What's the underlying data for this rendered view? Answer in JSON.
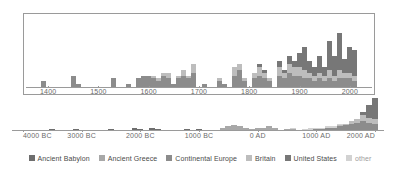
{
  "chart_data": {
    "type": "bar",
    "title": "",
    "subtitle": "",
    "xlabel": "",
    "ylabel": "",
    "grid": false,
    "legend_position": "bottom",
    "stacked": true,
    "series_names": [
      "Ancient Babylon",
      "Ancient Greece",
      "Continental Europe",
      "Britain",
      "United States",
      "other"
    ],
    "series_colors": [
      "#6e6e6e",
      "#a8a8a8",
      "#8c8c8c",
      "#bdbdbd",
      "#777777",
      "#d2d2d2"
    ],
    "panels": [
      {
        "name": "inset-recent",
        "xlim": [
          1350,
          2050
        ],
        "ylim": [
          0,
          26
        ],
        "xticks": [
          1400,
          1500,
          1600,
          1700,
          1800,
          1900,
          2000
        ],
        "xticklabels": [
          "1400",
          "1500",
          "1600",
          "1700",
          "1800",
          "1900",
          "2000"
        ],
        "bin_width": 10,
        "bins": [
          {
            "x": 1390,
            "values": [
              0,
              0,
              2,
              0,
              0,
              0
            ]
          },
          {
            "x": 1450,
            "values": [
              0,
              0,
              4,
              0,
              0,
              0
            ]
          },
          {
            "x": 1460,
            "values": [
              0,
              0,
              1,
              0,
              0,
              0
            ]
          },
          {
            "x": 1530,
            "values": [
              0,
              0,
              3,
              0,
              0,
              0
            ]
          },
          {
            "x": 1560,
            "values": [
              0,
              0,
              1,
              0,
              0,
              0
            ]
          },
          {
            "x": 1580,
            "values": [
              0,
              0,
              3,
              0,
              0,
              0
            ]
          },
          {
            "x": 1590,
            "values": [
              0,
              0,
              4,
              0,
              0,
              0
            ]
          },
          {
            "x": 1600,
            "values": [
              0,
              0,
              4,
              0,
              0,
              0
            ]
          },
          {
            "x": 1610,
            "values": [
              0,
              0,
              3,
              1,
              0,
              0
            ]
          },
          {
            "x": 1620,
            "values": [
              0,
              0,
              2,
              1,
              0,
              0
            ]
          },
          {
            "x": 1630,
            "values": [
              0,
              0,
              4,
              1,
              0,
              0
            ]
          },
          {
            "x": 1640,
            "values": [
              0,
              0,
              3,
              2,
              0,
              0
            ]
          },
          {
            "x": 1650,
            "values": [
              0,
              0,
              1,
              0,
              0,
              0
            ]
          },
          {
            "x": 1660,
            "values": [
              0,
              0,
              3,
              1,
              0,
              0
            ]
          },
          {
            "x": 1670,
            "values": [
              0,
              0,
              4,
              2,
              0,
              0
            ]
          },
          {
            "x": 1680,
            "values": [
              0,
              0,
              3,
              1,
              0,
              0
            ]
          },
          {
            "x": 1690,
            "values": [
              0,
              0,
              5,
              3,
              0,
              0
            ]
          },
          {
            "x": 1710,
            "values": [
              0,
              0,
              1,
              0,
              0,
              0
            ]
          },
          {
            "x": 1740,
            "values": [
              0,
              0,
              2,
              1,
              0,
              0
            ]
          },
          {
            "x": 1750,
            "values": [
              0,
              0,
              1,
              0,
              0,
              0
            ]
          },
          {
            "x": 1770,
            "values": [
              0,
              0,
              4,
              3,
              0,
              0
            ]
          },
          {
            "x": 1780,
            "values": [
              0,
              0,
              6,
              2,
              0,
              0
            ]
          },
          {
            "x": 1790,
            "values": [
              0,
              0,
              2,
              1,
              0,
              0
            ]
          },
          {
            "x": 1810,
            "values": [
              0,
              0,
              3,
              2,
              0,
              0
            ]
          },
          {
            "x": 1820,
            "values": [
              0,
              0,
              4,
              3,
              1,
              0
            ]
          },
          {
            "x": 1830,
            "values": [
              0,
              0,
              3,
              2,
              1,
              0
            ]
          },
          {
            "x": 1840,
            "values": [
              0,
              0,
              2,
              1,
              0,
              0
            ]
          },
          {
            "x": 1860,
            "values": [
              0,
              0,
              4,
              3,
              2,
              0
            ]
          },
          {
            "x": 1870,
            "values": [
              0,
              0,
              3,
              2,
              1,
              0
            ]
          },
          {
            "x": 1880,
            "values": [
              0,
              0,
              5,
              3,
              3,
              0
            ]
          },
          {
            "x": 1890,
            "values": [
              0,
              0,
              4,
              3,
              2,
              0
            ]
          },
          {
            "x": 1900,
            "values": [
              0,
              0,
              4,
              3,
              5,
              0
            ]
          },
          {
            "x": 1910,
            "values": [
              0,
              0,
              3,
              3,
              8,
              0
            ]
          },
          {
            "x": 1920,
            "values": [
              0,
              0,
              3,
              2,
              4,
              0
            ]
          },
          {
            "x": 1930,
            "values": [
              0,
              0,
              2,
              2,
              3,
              0
            ]
          },
          {
            "x": 1940,
            "values": [
              0,
              0,
              3,
              2,
              6,
              0
            ]
          },
          {
            "x": 1950,
            "values": [
              0,
              0,
              2,
              2,
              3,
              0
            ]
          },
          {
            "x": 1960,
            "values": [
              0,
              0,
              3,
              3,
              10,
              0
            ]
          },
          {
            "x": 1970,
            "values": [
              0,
              0,
              2,
              2,
              7,
              0
            ]
          },
          {
            "x": 1980,
            "values": [
              0,
              0,
              3,
              3,
              13,
              0
            ]
          },
          {
            "x": 1990,
            "values": [
              0,
              0,
              3,
              2,
              5,
              0
            ]
          },
          {
            "x": 2000,
            "values": [
              0,
              0,
              3,
              2,
              9,
              0
            ]
          },
          {
            "x": 2010,
            "values": [
              0,
              0,
              2,
              2,
              9,
              0
            ]
          }
        ]
      },
      {
        "name": "full-range",
        "xlim": [
          -4000,
          2000
        ],
        "ylim": [
          0,
          26
        ],
        "xticks": [
          -4000,
          -3000,
          -2000,
          -1000,
          0,
          1000,
          2000
        ],
        "xticklabels": [
          "4000 BC",
          "3000 BC",
          "2000 BC",
          "1000 BC",
          "0 AD",
          "1000 AD",
          "2000 AD"
        ],
        "bin_width": 100,
        "bins": [
          {
            "x": -3500,
            "values": [
              1,
              0,
              0,
              0,
              0,
              0
            ]
          },
          {
            "x": -3100,
            "values": [
              1,
              0,
              0,
              0,
              0,
              0
            ]
          },
          {
            "x": -2500,
            "values": [
              1,
              0,
              0,
              0,
              0,
              0
            ]
          },
          {
            "x": -2100,
            "values": [
              2,
              0,
              0,
              0,
              0,
              0
            ]
          },
          {
            "x": -2000,
            "values": [
              1,
              0,
              0,
              0,
              0,
              0
            ]
          },
          {
            "x": -1800,
            "values": [
              2,
              0,
              0,
              0,
              0,
              0
            ]
          },
          {
            "x": -1700,
            "values": [
              1,
              0,
              0,
              0,
              0,
              0
            ]
          },
          {
            "x": -1200,
            "values": [
              1,
              0,
              0,
              0,
              0,
              0
            ]
          },
          {
            "x": -1000,
            "values": [
              1,
              0,
              0,
              0,
              0,
              0
            ]
          },
          {
            "x": -600,
            "values": [
              0,
              2,
              0,
              0,
              0,
              0
            ]
          },
          {
            "x": -500,
            "values": [
              0,
              3,
              0,
              0,
              0,
              0
            ]
          },
          {
            "x": -400,
            "values": [
              0,
              4,
              0,
              0,
              0,
              0
            ]
          },
          {
            "x": -300,
            "values": [
              0,
              3,
              0,
              0,
              0,
              0
            ]
          },
          {
            "x": -200,
            "values": [
              0,
              2,
              0,
              0,
              0,
              0
            ]
          },
          {
            "x": -100,
            "values": [
              0,
              1,
              0,
              0,
              0,
              0
            ]
          },
          {
            "x": 0,
            "values": [
              0,
              2,
              0,
              0,
              0,
              0
            ]
          },
          {
            "x": 100,
            "values": [
              0,
              2,
              0,
              0,
              0,
              0
            ]
          },
          {
            "x": 200,
            "values": [
              0,
              3,
              0,
              0,
              0,
              0
            ]
          },
          {
            "x": 300,
            "values": [
              0,
              2,
              0,
              0,
              0,
              0
            ]
          },
          {
            "x": 500,
            "values": [
              0,
              1,
              0,
              0,
              0,
              0
            ]
          },
          {
            "x": 600,
            "values": [
              0,
              1,
              0,
              0,
              0,
              1
            ]
          },
          {
            "x": 800,
            "values": [
              0,
              0,
              0,
              0,
              0,
              1
            ]
          },
          {
            "x": 900,
            "values": [
              0,
              0,
              0,
              0,
              0,
              2
            ]
          },
          {
            "x": 1000,
            "values": [
              0,
              0,
              1,
              0,
              0,
              1
            ]
          },
          {
            "x": 1100,
            "values": [
              0,
              0,
              1,
              0,
              0,
              1
            ]
          },
          {
            "x": 1200,
            "values": [
              0,
              0,
              2,
              0,
              0,
              1
            ]
          },
          {
            "x": 1300,
            "values": [
              0,
              0,
              2,
              0,
              0,
              1
            ]
          },
          {
            "x": 1400,
            "values": [
              0,
              0,
              3,
              1,
              0,
              1
            ]
          },
          {
            "x": 1500,
            "values": [
              0,
              0,
              4,
              1,
              0,
              0
            ]
          },
          {
            "x": 1600,
            "values": [
              0,
              0,
              5,
              2,
              0,
              0
            ]
          },
          {
            "x": 1700,
            "values": [
              0,
              0,
              6,
              3,
              0,
              0
            ]
          },
          {
            "x": 1800,
            "values": [
              0,
              0,
              7,
              5,
              3,
              0
            ]
          },
          {
            "x": 1900,
            "values": [
              0,
              0,
              6,
              4,
              10,
              0
            ]
          },
          {
            "x": 2000,
            "values": [
              0,
              0,
              5,
              4,
              17,
              0
            ]
          }
        ]
      }
    ],
    "legend": [
      {
        "label": "Ancient Babylon",
        "color": "#6e6e6e"
      },
      {
        "label": "Ancient Greece",
        "color": "#a8a8a8"
      },
      {
        "label": "Continental Europe",
        "color": "#8c8c8c"
      },
      {
        "label": "Britain",
        "color": "#bdbdbd"
      },
      {
        "label": "United States",
        "color": "#777777"
      },
      {
        "label": "other",
        "color": "#d2d2d2"
      }
    ]
  }
}
